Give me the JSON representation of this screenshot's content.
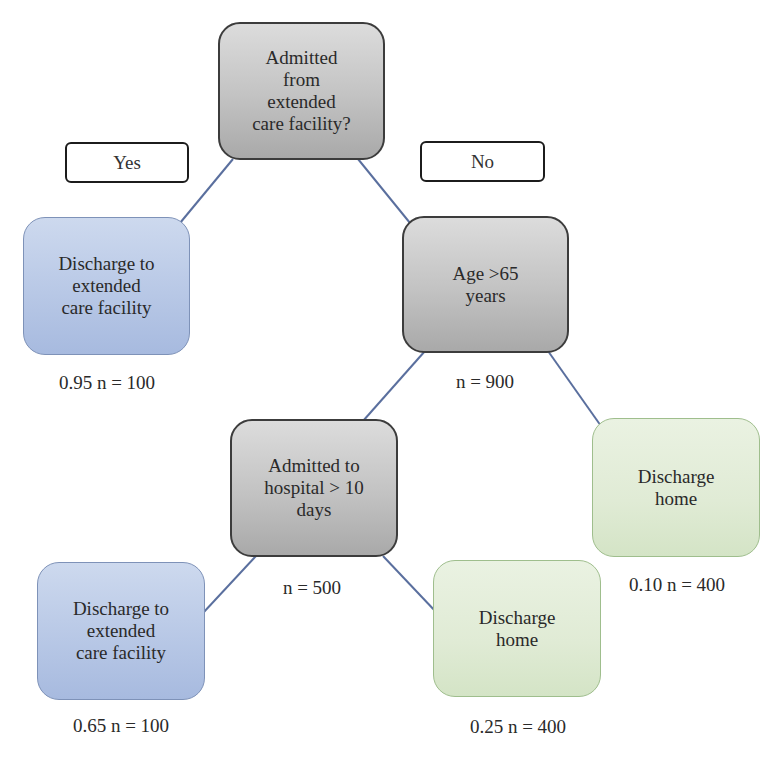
{
  "diagram": {
    "type": "decision-tree",
    "colors": {
      "decision_node": "#c2c2c2",
      "extended_care_node": "#b8c8e6",
      "home_node": "#e0ebd5",
      "connector": "#5a6f9e"
    },
    "branch_labels": {
      "yes": "Yes",
      "no": "No"
    },
    "nodes": {
      "root": {
        "text": "Admitted\nfrom\nextended\ncare facility?"
      },
      "left_leaf": {
        "text": "Discharge to\nextended\ncare facility",
        "caption": "0.95 n = 100"
      },
      "age": {
        "text": "Age >65\nyears",
        "caption": "n = 900"
      },
      "hospital": {
        "text": "Admitted to\nhospital > 10\ndays",
        "caption": "n = 500"
      },
      "home_right": {
        "text": "Discharge\nhome",
        "caption": "0.10 n = 400"
      },
      "extended_bottom": {
        "text": "Discharge to\nextended\ncare facility",
        "caption": "0.65 n = 100"
      },
      "home_bottom": {
        "text": "Discharge\nhome",
        "caption": "0.25 n = 400"
      }
    },
    "edges": [
      {
        "from": "root",
        "to": "left_leaf",
        "branch": "Yes"
      },
      {
        "from": "root",
        "to": "age",
        "branch": "No"
      },
      {
        "from": "age",
        "to": "hospital"
      },
      {
        "from": "age",
        "to": "home_right"
      },
      {
        "from": "hospital",
        "to": "extended_bottom"
      },
      {
        "from": "hospital",
        "to": "home_bottom"
      }
    ]
  }
}
